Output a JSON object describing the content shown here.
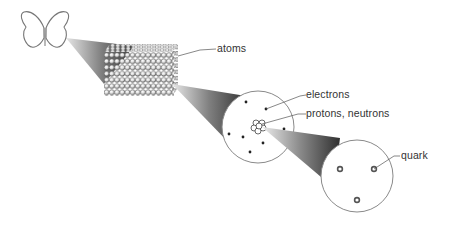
{
  "diagram": {
    "type": "scale-of-matter",
    "labels": {
      "atoms": "atoms",
      "electrons": "electrons",
      "protons_neutrons": "protons, neutrons",
      "quark": "quark"
    },
    "stages": [
      {
        "name": "butterfly"
      },
      {
        "name": "atom-lattice"
      },
      {
        "name": "atom"
      },
      {
        "name": "nucleon"
      }
    ],
    "colors": {
      "outline": "#7a7a7a",
      "beam_dark": "#3a3a3a",
      "beam_light": "#e8e8e8",
      "text": "#333333"
    }
  }
}
